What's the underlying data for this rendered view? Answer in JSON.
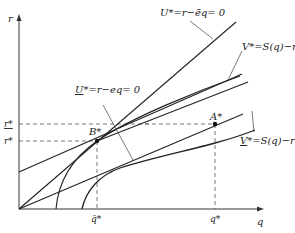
{
  "axes": {
    "y_label": "r",
    "x_label": "q"
  },
  "ticks": {
    "r_upper": "r*",
    "r_lower": "r*",
    "q_bar": "q̄*",
    "q_star": "q*"
  },
  "points": {
    "B": "B*",
    "A": "A*"
  },
  "curves": {
    "U_upper": "U* = r − ēq = 0",
    "U_lower": "U* = r − eq = 0",
    "V_upper": "V* = S(q) − r",
    "V_lower": "V* = S(q) − r"
  },
  "labels": {
    "U_upper_sym": "U",
    "U_upper_rest": "*=r−ēq= 0",
    "U_lower_sym": "U",
    "U_lower_rest": "*=r−eq= 0",
    "V_upper_sym": "V",
    "V_upper_rest": "*=S(q)−r",
    "V_lower_sym": "V",
    "V_lower_rest": "*=S(q)−r"
  }
}
